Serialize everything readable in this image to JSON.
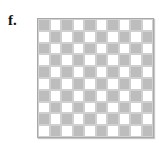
{
  "panel_label": "f.",
  "board": {
    "rows": 10,
    "cols": 10,
    "first_cell": "gray",
    "colors": {
      "gray": "#bdbdbd",
      "white": "#ffffff"
    }
  }
}
